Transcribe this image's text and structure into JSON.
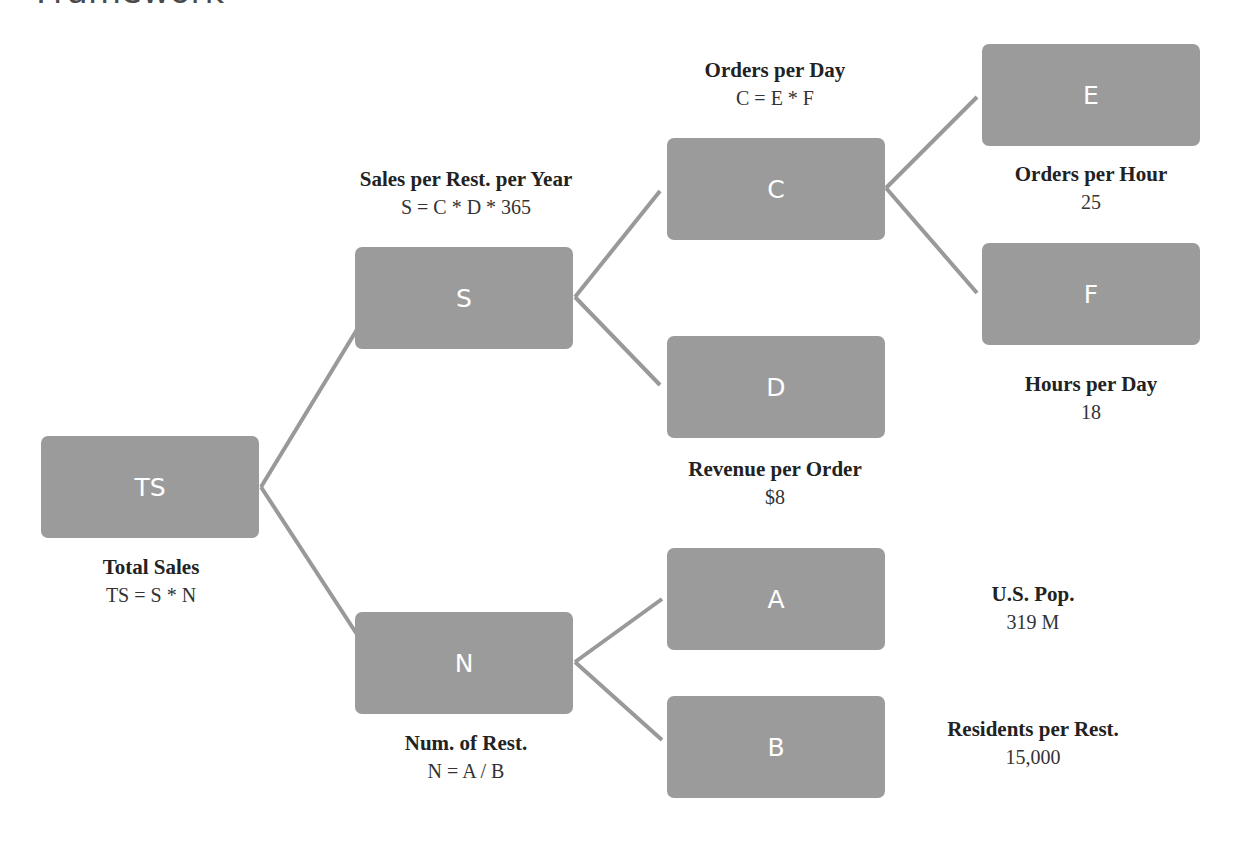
{
  "page": {
    "title": "Framework"
  },
  "colors": {
    "node_fill": "#9b9b9b",
    "node_text": "#ffffff",
    "connector": "#999999",
    "caption_text": "#222222"
  },
  "nodes": {
    "ts": {
      "label": "TS",
      "title": "Total Sales",
      "value": "TS = S * N"
    },
    "s": {
      "label": "S",
      "title": "Sales per Rest. per Year",
      "value": "S = C * D * 365"
    },
    "n": {
      "label": "N",
      "title": "Num. of Rest.",
      "value": "N = A / B"
    },
    "c": {
      "label": "C",
      "title": "Orders per Day",
      "value": "C = E * F"
    },
    "d": {
      "label": "D",
      "title": "Revenue per Order",
      "value": "$8"
    },
    "a": {
      "label": "A",
      "title": "U.S. Pop.",
      "value": "319 M"
    },
    "b": {
      "label": "B",
      "title": "Residents per Rest.",
      "value": "15,000"
    },
    "e": {
      "label": "E",
      "title": "Orders per Hour",
      "value": "25"
    },
    "f": {
      "label": "F",
      "title": "Hours per Day",
      "value": "18"
    }
  },
  "edges": [
    {
      "from": "TS",
      "to": "S"
    },
    {
      "from": "TS",
      "to": "N"
    },
    {
      "from": "S",
      "to": "C"
    },
    {
      "from": "S",
      "to": "D"
    },
    {
      "from": "C",
      "to": "E"
    },
    {
      "from": "C",
      "to": "F"
    },
    {
      "from": "N",
      "to": "A"
    },
    {
      "from": "N",
      "to": "B"
    }
  ]
}
